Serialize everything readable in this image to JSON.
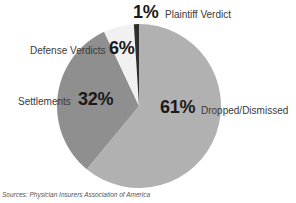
{
  "chart_data": {
    "type": "pie",
    "title": "",
    "categories": [
      "Dropped/Dismissed",
      "Settlements",
      "Defense Verdicts",
      "Plaintiff Verdict"
    ],
    "values": [
      61,
      32,
      6,
      1
    ],
    "value_labels": [
      "61%",
      "32%",
      "6%",
      "1%"
    ],
    "colors": [
      "#b1b1b1",
      "#8f8f8f",
      "#f1f1f1",
      "#2e2e2e"
    ],
    "start_angle_deg": 0,
    "direction": "clockwise",
    "legend": "none (inline labels)",
    "source": "Sources: Physician Insurers Association of America"
  },
  "labels": {
    "plaintiff": {
      "pct": "1%",
      "name": "Plaintiff Verdict"
    },
    "defense": {
      "pct": "6%",
      "name": "Defense Verdicts"
    },
    "settlements": {
      "pct": "32%",
      "name": "Settlements"
    },
    "dropped": {
      "pct": "61%",
      "name": "Dropped/Dismissed"
    }
  },
  "source": "Sources: Physician Insurers Association of America"
}
